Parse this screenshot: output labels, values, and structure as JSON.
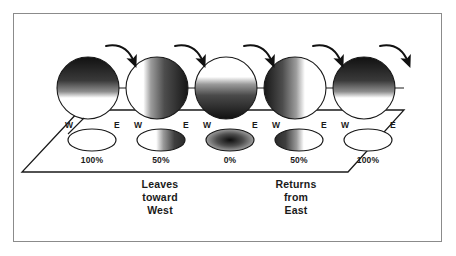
{
  "figure": {
    "frame_color": "#8b8b8b",
    "background": "#ffffff",
    "ink_color": "#1a1a1a"
  },
  "spheres": [
    {
      "name": "sphere-1",
      "cx": 88,
      "cy": 88,
      "r": 31,
      "shading": "top-dark",
      "illumination_percent": 100
    },
    {
      "name": "sphere-2",
      "cx": 157,
      "cy": 88,
      "r": 31,
      "shading": "right-dark",
      "illumination_percent": 50
    },
    {
      "name": "sphere-3",
      "cx": 226,
      "cy": 88,
      "r": 31,
      "shading": "bottom-dark",
      "illumination_percent": 0
    },
    {
      "name": "sphere-4",
      "cx": 295,
      "cy": 88,
      "r": 31,
      "shading": "left-dark",
      "illumination_percent": 50
    },
    {
      "name": "sphere-5",
      "cx": 364,
      "cy": 88,
      "r": 31,
      "shading": "top-dark",
      "illumination_percent": 100
    }
  ],
  "arrows": [
    {
      "name": "rotation-arrow-1",
      "from_sphere": 1,
      "to_sphere": 2
    },
    {
      "name": "rotation-arrow-2",
      "from_sphere": 2,
      "to_sphere": 3
    },
    {
      "name": "rotation-arrow-3",
      "from_sphere": 3,
      "to_sphere": 4
    },
    {
      "name": "rotation-arrow-4",
      "from_sphere": 4,
      "to_sphere": 5
    },
    {
      "name": "rotation-arrow-5",
      "from_sphere": 5,
      "to_sphere": null
    }
  ],
  "ellipses": [
    {
      "name": "ground-ellipse-1",
      "cx": 92,
      "cy": 140,
      "rx": 24,
      "ry": 11,
      "fill": "none",
      "west_label": "W",
      "east_label": "E",
      "percent_label": "100%"
    },
    {
      "name": "ground-ellipse-2",
      "cx": 161,
      "cy": 140,
      "rx": 24,
      "ry": 11,
      "fill": "right-dark",
      "west_label": "W",
      "east_label": "E",
      "percent_label": "50%"
    },
    {
      "name": "ground-ellipse-3",
      "cx": 230,
      "cy": 140,
      "rx": 24,
      "ry": 11,
      "fill": "full-dark",
      "west_label": "W",
      "east_label": "E",
      "percent_label": "0%"
    },
    {
      "name": "ground-ellipse-4",
      "cx": 299,
      "cy": 140,
      "rx": 24,
      "ry": 11,
      "fill": "left-dark",
      "west_label": "W",
      "east_label": "E",
      "percent_label": "50%"
    },
    {
      "name": "ground-ellipse-5",
      "cx": 368,
      "cy": 140,
      "rx": 24,
      "ry": 11,
      "fill": "none",
      "west_label": "W",
      "east_label": "E",
      "percent_label": "100%"
    }
  ],
  "annotations": {
    "left": {
      "line1": "Leaves",
      "line2": "toward",
      "line3": "West"
    },
    "right": {
      "line1": "Returns",
      "line2": "from",
      "line3": "East"
    }
  }
}
